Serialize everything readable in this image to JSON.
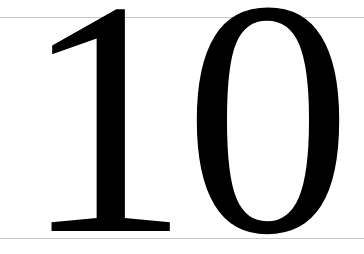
{
  "numeral": {
    "text": "10"
  },
  "colors": {
    "text": "#000000",
    "rule": "#c8c8c8",
    "background": "#ffffff"
  }
}
